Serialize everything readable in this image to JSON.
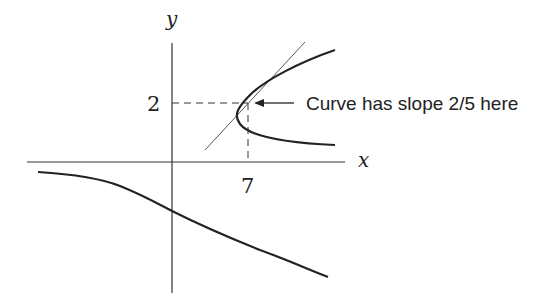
{
  "axes": {
    "x_label": "x",
    "y_label": "y",
    "x_tick_label": "7",
    "y_tick_label": "2"
  },
  "annotation": {
    "text": "Curve has slope 2/5 here"
  },
  "point": {
    "x": 7,
    "y": 2,
    "slope": "2/5"
  },
  "colors": {
    "ink": "#222222",
    "background": "#ffffff"
  }
}
